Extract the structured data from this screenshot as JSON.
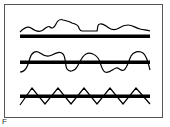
{
  "figure": {
    "panel_label": "F",
    "rows": [
      {
        "id": "row-1",
        "pattern": "irregular wavy line above baseline"
      },
      {
        "id": "row-2",
        "pattern": "sinusoidal wavy line crossing baseline"
      },
      {
        "id": "row-3",
        "pattern": "regular zigzag crossing baseline"
      }
    ],
    "colors": {
      "line": "#000000",
      "frame": "#555555",
      "background": "#ffffff"
    }
  }
}
